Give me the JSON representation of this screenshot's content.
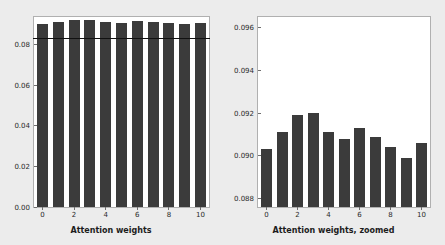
{
  "chart_data": [
    {
      "type": "bar",
      "panel": "left",
      "title": "",
      "xlabel": "Attention weights",
      "ylabel": "",
      "categories": [
        "0",
        "1",
        "2",
        "3",
        "4",
        "5",
        "6",
        "7",
        "8",
        "9",
        "10"
      ],
      "values": [
        0.0903,
        0.0911,
        0.0919,
        0.092,
        0.0911,
        0.0908,
        0.0913,
        0.0909,
        0.0904,
        0.0899,
        0.0906
      ],
      "xticks": [
        0,
        2,
        4,
        6,
        8,
        10
      ],
      "xtick_labels": [
        "0",
        "2",
        "4",
        "6",
        "8",
        "10"
      ],
      "yticks": [
        0.0,
        0.02,
        0.04,
        0.06,
        0.08
      ],
      "ytick_labels": [
        "0.00",
        "0.02",
        "0.04",
        "0.06",
        "0.08"
      ],
      "ylim": [
        0.0,
        0.0935
      ],
      "grid": false,
      "bar_color": "#3b3b3b",
      "reference_line": {
        "value": 0.0833,
        "color": "#111111",
        "label": ""
      }
    },
    {
      "type": "bar",
      "panel": "right",
      "title": "",
      "xlabel": "Attention weights, zoomed",
      "ylabel": "",
      "categories": [
        "0",
        "1",
        "2",
        "3",
        "4",
        "5",
        "6",
        "7",
        "8",
        "9",
        "10"
      ],
      "values": [
        0.0903,
        0.0911,
        0.0919,
        0.092,
        0.0911,
        0.0908,
        0.0913,
        0.0909,
        0.0904,
        0.0899,
        0.0906
      ],
      "xticks": [
        0,
        2,
        4,
        6,
        8,
        10
      ],
      "xtick_labels": [
        "0",
        "2",
        "4",
        "6",
        "8",
        "10"
      ],
      "yticks": [
        0.088,
        0.09,
        0.092,
        0.094,
        0.096
      ],
      "ytick_labels": [
        "0.088",
        "0.090",
        "0.092",
        "0.094",
        "0.096"
      ],
      "ylim": [
        0.0876,
        0.0965
      ],
      "grid": false,
      "bar_color": "#3b3b3b"
    }
  ],
  "figure": {
    "background_color": "#ececec",
    "axes_background_color": "#ffffff",
    "axes_edge_color": "#b0b0b0",
    "tick_color": "#2a2a2a"
  }
}
